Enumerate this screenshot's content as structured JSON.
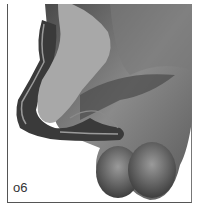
{
  "figure": {
    "label": "o6",
    "colors": {
      "background": "#ffffff",
      "section_fill": "#a8a8a8",
      "tissue_dark": "#3a3a3a",
      "tissue_mid": "#6e6e6e",
      "tissue_light": "#9a9a9a",
      "frame": "#555555"
    }
  }
}
